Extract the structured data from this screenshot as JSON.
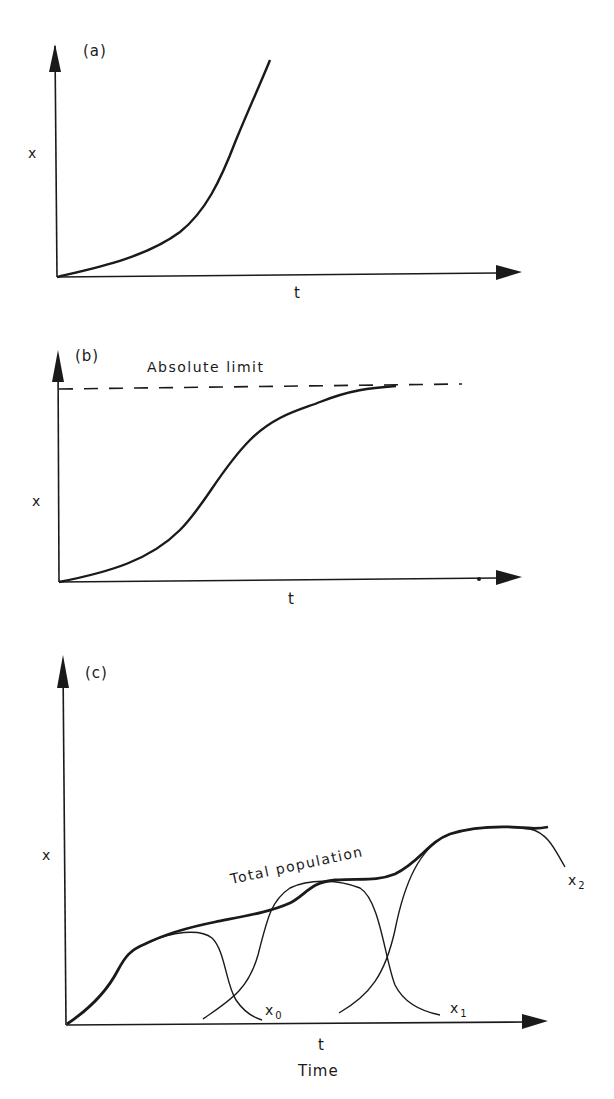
{
  "header": {
    "cropped_text": "... g ... g ... y ..."
  },
  "panels": {
    "a": {
      "tag": "(a)",
      "ylabel": "x",
      "xlabel": "t",
      "description": "Exponential growth"
    },
    "b": {
      "tag": "(b)",
      "ylabel": "x",
      "xlabel": "t",
      "limit_label": "Absolute limit",
      "description": "Logistic (S-shaped) growth approaching an absolute limit"
    },
    "c": {
      "tag": "(c)",
      "ylabel": "x",
      "xlabel": "t",
      "xlabel2": "Time",
      "envelope_label": "Total population",
      "curves": [
        {
          "name": "x",
          "sub": "0"
        },
        {
          "name": "x",
          "sub": "1"
        },
        {
          "name": "x",
          "sub": "2"
        }
      ],
      "description": "Successive logistic sub-populations x0, x1, x2 forming a total population envelope"
    }
  },
  "colors": {
    "ink": "#1a1a1a",
    "background": "#ffffff"
  }
}
